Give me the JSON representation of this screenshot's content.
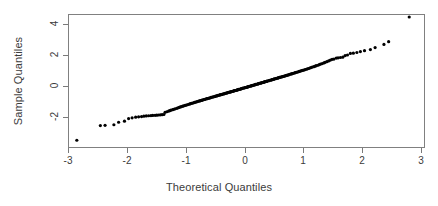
{
  "figure": {
    "kind": "qq-plot",
    "background": "#ffffff",
    "frame_color": "#808080",
    "axis_color": "#7a7a7a",
    "text_color": "#3b3b3b",
    "point_color": "#000000"
  },
  "labels": {
    "xlabel": "Theoretical Quantiles",
    "ylabel": "Sample Quantiles"
  },
  "axes": {
    "x_ticks": [
      "-3",
      "-2",
      "-1",
      "0",
      "1",
      "2",
      "3"
    ],
    "y_ticks": [
      "4",
      "2",
      "0",
      "-2"
    ],
    "x_tick_values": [
      -3,
      -2,
      -1,
      0,
      1,
      2,
      3
    ],
    "y_tick_values": [
      4,
      2,
      0,
      -2
    ]
  },
  "chart_data": {
    "type": "scatter",
    "title": "",
    "xlabel": "Theoretical Quantiles",
    "ylabel": "Sample Quantiles",
    "xlim": [
      -3.1,
      3.1
    ],
    "ylim": [
      -3.72,
      4.7
    ],
    "grid": false,
    "legend": null,
    "marker": "filled-circle",
    "marker_size_px": 2.1,
    "series": [
      {
        "name": "Sample vs Theoretical Quantiles",
        "x": [
          -2.85,
          -2.45,
          -2.37,
          -2.22,
          -2.14,
          -2.04,
          -1.97,
          -1.91,
          -1.85,
          -1.8,
          -1.75,
          -1.71,
          -1.67,
          -1.63,
          -1.59,
          -1.56,
          -1.52,
          -1.49,
          -1.46,
          -1.43,
          -1.4,
          -1.37,
          -1.35,
          -1.32,
          -1.29,
          -1.27,
          -1.25,
          -1.22,
          -1.2,
          -1.18,
          -1.15,
          -1.13,
          -1.11,
          -1.09,
          -1.07,
          -1.05,
          -1.03,
          -1.01,
          -0.99,
          -0.97,
          -0.95,
          -0.93,
          -0.92,
          -0.9,
          -0.88,
          -0.86,
          -0.85,
          -0.83,
          -0.81,
          -0.8,
          -0.78,
          -0.76,
          -0.75,
          -0.73,
          -0.72,
          -0.7,
          -0.69,
          -0.67,
          -0.66,
          -0.64,
          -0.63,
          -0.61,
          -0.6,
          -0.58,
          -0.57,
          -0.56,
          -0.54,
          -0.53,
          -0.51,
          -0.5,
          -0.49,
          -0.47,
          -0.46,
          -0.45,
          -0.43,
          -0.42,
          -0.41,
          -0.39,
          -0.38,
          -0.37,
          -0.35,
          -0.34,
          -0.33,
          -0.32,
          -0.3,
          -0.29,
          -0.28,
          -0.27,
          -0.25,
          -0.24,
          -0.23,
          -0.22,
          -0.2,
          -0.19,
          -0.18,
          -0.17,
          -0.16,
          -0.14,
          -0.13,
          -0.12,
          -0.11,
          -0.1,
          -0.08,
          -0.07,
          -0.06,
          -0.05,
          -0.04,
          -0.03,
          -0.01,
          0.0,
          0.01,
          0.03,
          0.04,
          0.05,
          0.06,
          0.07,
          0.08,
          0.1,
          0.11,
          0.12,
          0.13,
          0.14,
          0.16,
          0.17,
          0.18,
          0.19,
          0.2,
          0.22,
          0.23,
          0.24,
          0.25,
          0.27,
          0.28,
          0.29,
          0.3,
          0.32,
          0.33,
          0.34,
          0.35,
          0.37,
          0.38,
          0.39,
          0.41,
          0.42,
          0.43,
          0.45,
          0.46,
          0.47,
          0.49,
          0.5,
          0.51,
          0.53,
          0.54,
          0.56,
          0.57,
          0.58,
          0.6,
          0.61,
          0.63,
          0.64,
          0.66,
          0.67,
          0.69,
          0.7,
          0.72,
          0.73,
          0.75,
          0.76,
          0.78,
          0.8,
          0.81,
          0.83,
          0.85,
          0.86,
          0.88,
          0.9,
          0.92,
          0.93,
          0.95,
          0.97,
          0.99,
          1.01,
          1.03,
          1.05,
          1.07,
          1.09,
          1.11,
          1.13,
          1.15,
          1.18,
          1.2,
          1.22,
          1.25,
          1.27,
          1.29,
          1.32,
          1.35,
          1.37,
          1.4,
          1.43,
          1.46,
          1.49,
          1.52,
          1.56,
          1.59,
          1.63,
          1.67,
          1.71,
          1.75,
          1.8,
          1.85,
          1.91,
          1.97,
          2.04,
          2.14,
          2.22,
          2.37,
          2.45,
          2.8
        ],
        "y": [
          -3.5,
          -2.55,
          -2.54,
          -2.5,
          -2.34,
          -2.27,
          -2.1,
          -2.05,
          -2.01,
          -1.99,
          -1.97,
          -1.95,
          -1.93,
          -1.92,
          -1.91,
          -1.9,
          -1.89,
          -1.88,
          -1.87,
          -1.86,
          -1.85,
          -1.84,
          -1.7,
          -1.66,
          -1.62,
          -1.59,
          -1.56,
          -1.53,
          -1.5,
          -1.47,
          -1.44,
          -1.41,
          -1.38,
          -1.35,
          -1.33,
          -1.3,
          -1.28,
          -1.25,
          -1.23,
          -1.21,
          -1.18,
          -1.16,
          -1.14,
          -1.12,
          -1.1,
          -1.08,
          -1.06,
          -1.04,
          -1.02,
          -1.0,
          -0.98,
          -0.96,
          -0.94,
          -0.93,
          -0.91,
          -0.89,
          -0.87,
          -0.86,
          -0.84,
          -0.82,
          -0.81,
          -0.79,
          -0.78,
          -0.76,
          -0.74,
          -0.73,
          -0.71,
          -0.7,
          -0.68,
          -0.67,
          -0.65,
          -0.64,
          -0.62,
          -0.61,
          -0.59,
          -0.58,
          -0.56,
          -0.55,
          -0.54,
          -0.52,
          -0.51,
          -0.49,
          -0.48,
          -0.47,
          -0.45,
          -0.44,
          -0.42,
          -0.41,
          -0.4,
          -0.38,
          -0.37,
          -0.36,
          -0.34,
          -0.33,
          -0.32,
          -0.3,
          -0.29,
          -0.28,
          -0.26,
          -0.25,
          -0.24,
          -0.22,
          -0.21,
          -0.2,
          -0.18,
          -0.17,
          -0.16,
          -0.14,
          -0.13,
          -0.12,
          -0.1,
          -0.09,
          -0.08,
          -0.06,
          -0.05,
          -0.04,
          -0.02,
          -0.01,
          0.0,
          0.02,
          0.03,
          0.04,
          0.06,
          0.07,
          0.08,
          0.1,
          0.11,
          0.12,
          0.14,
          0.15,
          0.17,
          0.18,
          0.19,
          0.21,
          0.22,
          0.24,
          0.25,
          0.26,
          0.28,
          0.29,
          0.31,
          0.32,
          0.34,
          0.35,
          0.37,
          0.38,
          0.4,
          0.41,
          0.43,
          0.44,
          0.46,
          0.47,
          0.49,
          0.5,
          0.52,
          0.54,
          0.55,
          0.57,
          0.58,
          0.6,
          0.62,
          0.63,
          0.65,
          0.67,
          0.69,
          0.7,
          0.72,
          0.74,
          0.76,
          0.78,
          0.8,
          0.82,
          0.84,
          0.86,
          0.88,
          0.9,
          0.92,
          0.94,
          0.96,
          0.99,
          1.01,
          1.03,
          1.06,
          1.08,
          1.11,
          1.13,
          1.16,
          1.19,
          1.22,
          1.25,
          1.28,
          1.31,
          1.34,
          1.38,
          1.41,
          1.45,
          1.49,
          1.53,
          1.57,
          1.62,
          1.67,
          1.72,
          1.74,
          1.8,
          1.82,
          1.84,
          1.86,
          1.96,
          2.0,
          2.1,
          2.12,
          2.16,
          2.22,
          2.28,
          2.35,
          2.48,
          2.68,
          2.86,
          4.45
        ]
      }
    ]
  }
}
